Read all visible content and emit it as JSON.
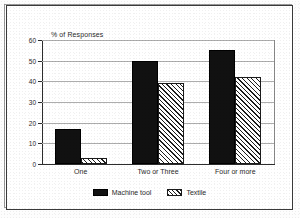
{
  "chart_data": {
    "type": "bar",
    "title": "",
    "xlabel": "",
    "ylabel": "% of Responses",
    "categories": [
      "One",
      "Two or Three",
      "Four or more"
    ],
    "series": [
      {
        "name": "Machine tool",
        "values": [
          17,
          50,
          55
        ],
        "fill": "solid-black"
      },
      {
        "name": "Textile",
        "values": [
          3,
          39,
          42
        ],
        "fill": "diagonal-hatch"
      }
    ],
    "ylim": [
      0,
      60
    ],
    "ytick_labels": [
      "0",
      "10",
      "20",
      "30",
      "40",
      "50",
      "60"
    ],
    "ytick_values": [
      0,
      10,
      20,
      30,
      40,
      50,
      60
    ],
    "grid": true,
    "legend_position": "bottom-center",
    "colors": {
      "series_1": "#111111",
      "series_2": "#ffffff",
      "hatch": "#1c1c1c",
      "axis": "#2c2c2c",
      "grid": "#adadad",
      "text": "#2a2a2a",
      "page_background": "#ffffff",
      "frame_border": "#3a3a3a"
    }
  },
  "figure": {
    "axis_title": "% of Responses"
  },
  "legend": {
    "entries": [
      {
        "label": "Machine tool"
      },
      {
        "label": "Textile"
      }
    ]
  }
}
